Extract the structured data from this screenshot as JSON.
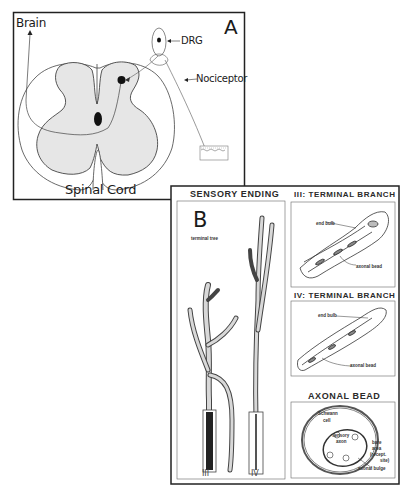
{
  "panel_a": {
    "letter": "A",
    "labels": {
      "brain": "Brain",
      "drg": "DRG",
      "nociceptor": "Nociceptor",
      "spinal_cord": "Spinal Cord"
    }
  },
  "panel_b": {
    "letter": "B",
    "sensory_ending": {
      "title": "SENSORY ENDING",
      "terminal_tree": "terminal tree",
      "branch_labels": [
        "III",
        "IV"
      ]
    },
    "terminal_branch_iii": {
      "title": "III: TERMINAL BRANCH",
      "end_bulb": "end bulb",
      "axonal_bead": "axonal bead"
    },
    "terminal_branch_iv": {
      "title": "IV: TERMINAL BRANCH",
      "end_bulb": "end bulb",
      "axonal_bead": "axonal bead"
    },
    "axonal_bead": {
      "title": "AXONAL BEAD",
      "schwann_cell": [
        "Schwann",
        "cell"
      ],
      "sensory_axon": [
        "sensory",
        "axon"
      ],
      "bare_area": [
        "bare",
        "area",
        "(recept.",
        "site)"
      ],
      "axonal_bulge": "axonal bulge"
    }
  },
  "colors": {
    "line": "#333333",
    "gray_matter": "#e6e6e6",
    "background": "#ffffff"
  }
}
